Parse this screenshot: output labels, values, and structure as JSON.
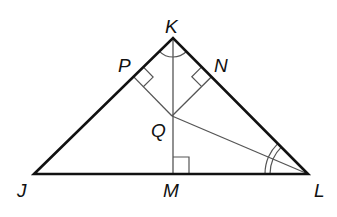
{
  "diagram": {
    "type": "geometry",
    "points": {
      "K": {
        "label": "K",
        "x": 173,
        "y": 38
      },
      "J": {
        "label": "J",
        "x": 34,
        "y": 174
      },
      "L": {
        "label": "L",
        "x": 308,
        "y": 174
      },
      "M": {
        "label": "M",
        "x": 173,
        "y": 174
      },
      "Q": {
        "label": "Q",
        "x": 172,
        "y": 116
      },
      "P": {
        "label": "P",
        "x": 133.5,
        "y": 76.6
      },
      "N": {
        "label": "N",
        "x": 211.5,
        "y": 76.8
      }
    },
    "segments": [
      {
        "from": "J",
        "to": "K",
        "style": "thick"
      },
      {
        "from": "K",
        "to": "L",
        "style": "thick"
      },
      {
        "from": "J",
        "to": "L",
        "style": "thick"
      },
      {
        "from": "K",
        "to": "M",
        "style": "thin"
      },
      {
        "from": "Q",
        "to": "P",
        "style": "thin"
      },
      {
        "from": "Q",
        "to": "N",
        "style": "thin"
      },
      {
        "from": "Q",
        "to": "L",
        "style": "thin"
      }
    ],
    "right_angle_marks": [
      "P",
      "N",
      "M"
    ],
    "congruent_angle_marks": [
      {
        "vertex": "K",
        "marks": 1,
        "angles": [
          "PKQ",
          "QKN"
        ]
      },
      {
        "vertex": "L",
        "marks": 2,
        "angles": [
          "KLQ",
          "QLM"
        ]
      }
    ],
    "labels": {
      "K": "K",
      "P": "P",
      "N": "N",
      "Q": "Q",
      "J": "J",
      "M": "M",
      "L": "L"
    },
    "colors": {
      "stroke": "#111111",
      "thin_stroke": "#555555",
      "background": "#ffffff"
    }
  }
}
